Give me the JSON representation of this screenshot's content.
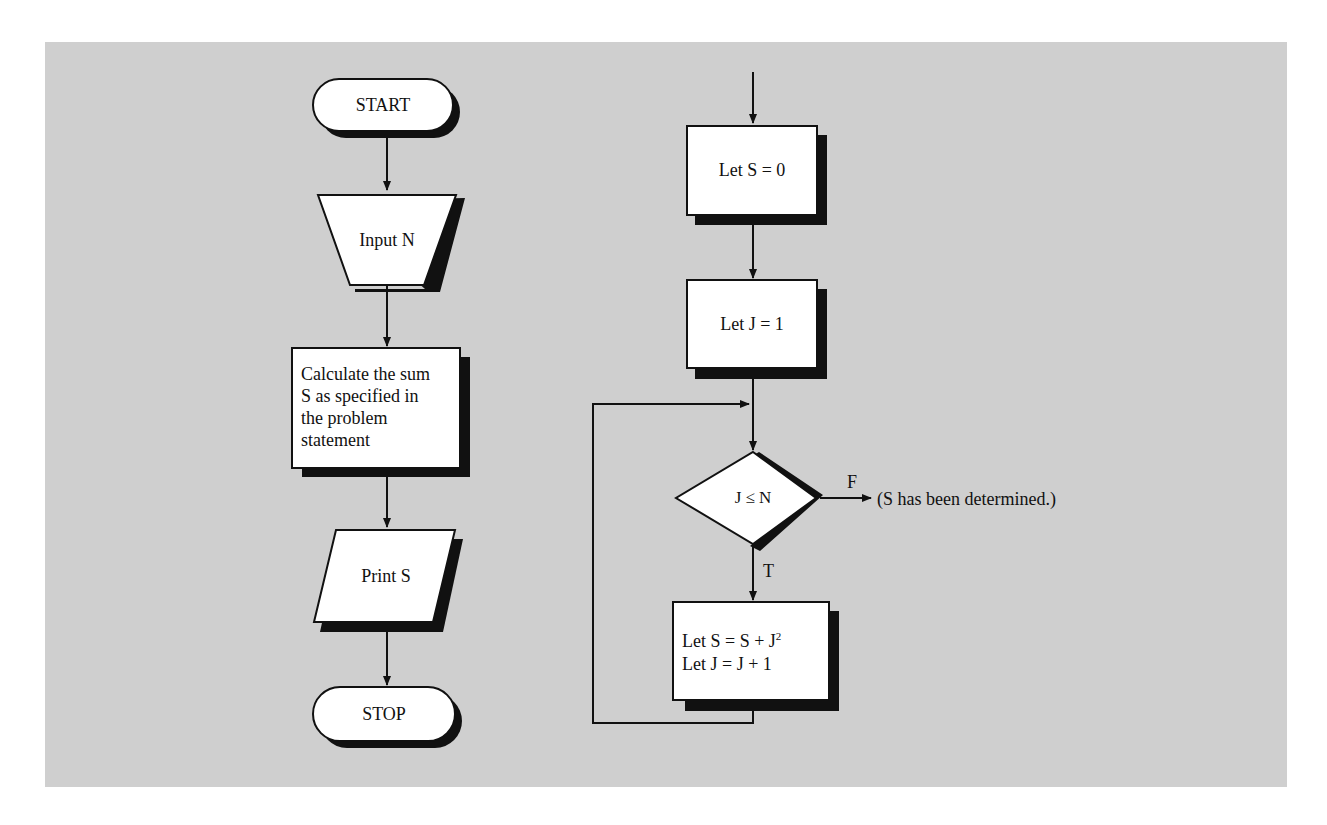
{
  "left_flowchart": {
    "start": "START",
    "input": "Input N",
    "calculate": "Calculate the sum\nS as specified in\nthe problem\nstatement",
    "print": "Print S",
    "stop": "STOP"
  },
  "right_flowchart": {
    "init_s": "Let S = 0",
    "init_j": "Let J = 1",
    "decision": "J ≤ N",
    "false_label": "F",
    "true_label": "T",
    "exit_note": "(S has been determined.)",
    "loop_line1_prefix": "Let S = S + J",
    "loop_line1_sup": "2",
    "loop_line2": "Let J = J + 1"
  },
  "colors": {
    "background": "#ffffff",
    "panel": "#cfcfcf",
    "shape_fill": "#ffffff",
    "stroke": "#111111",
    "shadow": "#111111"
  }
}
